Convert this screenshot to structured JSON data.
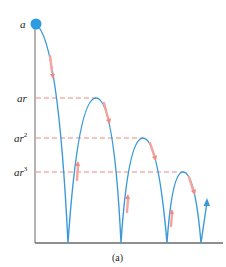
{
  "figure": {
    "caption": "(a)",
    "labels": {
      "a": "a",
      "ar": "ar",
      "ar2_base": "ar",
      "ar2_exp": "2",
      "ar3_base": "ar",
      "ar3_exp": "3"
    },
    "colors": {
      "curve": "#3a9ad9",
      "ball": "#2f9be0",
      "dashed": "#ee8a80",
      "arrow": "#f4a49c",
      "axis": "#888888"
    },
    "heights": [
      "a",
      "ar",
      "ar^2",
      "ar^3"
    ]
  }
}
